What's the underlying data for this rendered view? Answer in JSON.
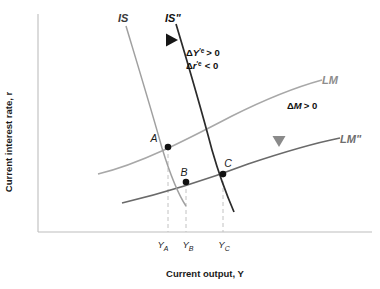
{
  "figure": {
    "kind": "is-lm-diagram",
    "background": "#ffffff"
  },
  "axes": {
    "x_title": "Current output, Y",
    "y_title": "Current interest rate, r",
    "axis_color": "#b9b9b9",
    "origin": {
      "x": 38,
      "y": 232
    },
    "x_end": 372,
    "y_top": 14
  },
  "curves": {
    "is": {
      "label": "IS",
      "color": "#a0a0a0",
      "label_pos": {
        "x": 118,
        "y": 20
      }
    },
    "is_shift": {
      "label": "IS\"",
      "color": "#2b2b2b",
      "label_pos": {
        "x": 166,
        "y": 20
      }
    },
    "lm": {
      "label": "LM",
      "color": "#a8a8a8",
      "label_pos": {
        "x": 322,
        "y": 81
      }
    },
    "lm_shift": {
      "label": "LM\"",
      "color": "#6a6a6a",
      "label_pos": {
        "x": 340,
        "y": 142
      }
    }
  },
  "points": [
    {
      "name": "A",
      "label": "A",
      "x": 168,
      "y": 147,
      "label_dx": -12,
      "label_dy": -6
    },
    {
      "name": "B",
      "label": "B",
      "x": 186,
      "y": 182,
      "label_dx": -2,
      "label_dy": -7
    },
    {
      "name": "C",
      "label": "C",
      "x": 223,
      "y": 174,
      "label_dx": 2,
      "label_dy": -8
    }
  ],
  "ticks": [
    {
      "label": "Y",
      "sub": "A",
      "x": 168,
      "text_x": 161,
      "text_y": 248
    },
    {
      "label": "Y",
      "sub": "B",
      "x": 186,
      "text_x": 186,
      "text_y": 248
    },
    {
      "label": "Y",
      "sub": "C",
      "x": 223,
      "text_x": 221,
      "text_y": 248
    }
  ],
  "annotations": {
    "is_shift_effect": {
      "line1": {
        "delta": "Δ",
        "var": "Y",
        "prime": "′e",
        "relation": "> 0"
      },
      "line2": {
        "delta": "Δ",
        "var": "r",
        "prime": "′e",
        "relation": "< 0"
      },
      "pos": {
        "x": 186,
        "y": 55
      }
    },
    "money_supply": {
      "delta": "Δ",
      "var": "M",
      "relation": "> 0",
      "pos": {
        "x": 287,
        "y": 108
      }
    }
  },
  "arrows": {
    "horizontal": {
      "name": "is-shift-arrow",
      "from": {
        "x": 130,
        "y": 40
      },
      "to": {
        "x": 176,
        "y": 40
      },
      "color_start": "#d8d8d8",
      "color_end": "#1c1c1c"
    },
    "vertical": {
      "name": "lm-shift-arrow",
      "from": {
        "x": 279,
        "y": 92
      },
      "to": {
        "x": 279,
        "y": 145
      },
      "color_start": "#d8d8d8",
      "color_end": "#8a8a8a"
    }
  },
  "dashed_droplines": {
    "color": "#bdbdbd",
    "baseline_y": 232
  }
}
